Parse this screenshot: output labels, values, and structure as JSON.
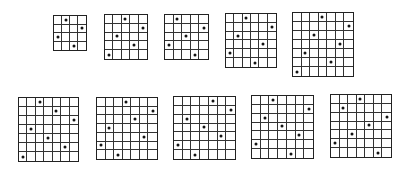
{
  "figure": {
    "grids": [
      {
        "id": 1,
        "size": 4,
        "x": 53,
        "y": 15,
        "w": 34,
        "h": 36,
        "dots": [
          1,
          3,
          0,
          2
        ]
      },
      {
        "id": 2,
        "size": 5,
        "x": 104,
        "y": 14,
        "w": 44,
        "h": 46,
        "dots": [
          2,
          4,
          1,
          3,
          0
        ]
      },
      {
        "id": 3,
        "size": 5,
        "x": 164,
        "y": 14,
        "w": 45,
        "h": 46,
        "dots": [
          1,
          4,
          2,
          0,
          3
        ]
      },
      {
        "id": 4,
        "size": 6,
        "x": 225,
        "y": 13,
        "w": 52,
        "h": 55,
        "dots": [
          2,
          5,
          1,
          4,
          0,
          3
        ]
      },
      {
        "id": 5,
        "size": 7,
        "x": 292,
        "y": 12,
        "w": 62,
        "h": 65,
        "dots": [
          3,
          6,
          2,
          5,
          1,
          4,
          0
        ]
      },
      {
        "id": 6,
        "size": 7,
        "x": 18,
        "y": 97,
        "w": 61,
        "h": 65,
        "dots": [
          2,
          4,
          6,
          1,
          3,
          5,
          0
        ]
      },
      {
        "id": 7,
        "size": 7,
        "x": 96,
        "y": 97,
        "w": 62,
        "h": 63,
        "dots": [
          3,
          6,
          4,
          1,
          5,
          0,
          2
        ]
      },
      {
        "id": 8,
        "size": 7,
        "x": 173,
        "y": 96,
        "w": 63,
        "h": 64,
        "dots": [
          4,
          6,
          1,
          3,
          5,
          0,
          2
        ]
      },
      {
        "id": 9,
        "size": 7,
        "x": 251,
        "y": 95,
        "w": 63,
        "h": 64,
        "dots": [
          2,
          6,
          1,
          3,
          5,
          0,
          4
        ]
      },
      {
        "id": 10,
        "size": 7,
        "x": 330,
        "y": 94,
        "w": 62,
        "h": 64,
        "dots": [
          3,
          1,
          6,
          4,
          2,
          0,
          5
        ]
      }
    ]
  }
}
